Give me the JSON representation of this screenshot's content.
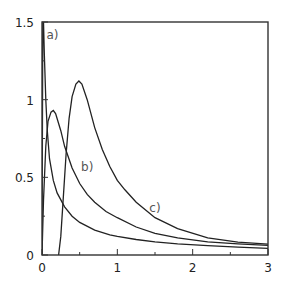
{
  "chart_data": {
    "type": "line",
    "title": "",
    "xlabel": "",
    "ylabel": "",
    "xlim": [
      0,
      3
    ],
    "ylim": [
      0,
      1.5
    ],
    "grid": false,
    "legend": "none (inline curve labels)",
    "x_ticks": [
      {
        "value": 0,
        "label": "0"
      },
      {
        "value": 1,
        "label": "1"
      },
      {
        "value": 2,
        "label": "2"
      },
      {
        "value": 3,
        "label": "3"
      }
    ],
    "x_minor_ticks": [
      0.5,
      1.5,
      2.5
    ],
    "y_ticks": [
      {
        "value": 0,
        "label": "0"
      },
      {
        "value": 0.5,
        "label": "0.5"
      },
      {
        "value": 1,
        "label": "1"
      },
      {
        "value": 1.5,
        "label": "1.5"
      }
    ],
    "y_minor_ticks": [
      0.25,
      0.75,
      1.25
    ],
    "series": [
      {
        "name": "a)",
        "label_pos": {
          "x": 0.14,
          "y": 1.39
        },
        "points": [
          [
            0.0,
            0.0
          ],
          [
            0.01,
            1.5
          ],
          [
            0.02,
            1.5
          ],
          [
            0.03,
            1.3
          ],
          [
            0.05,
            1.0
          ],
          [
            0.07,
            0.8
          ],
          [
            0.1,
            0.62
          ],
          [
            0.15,
            0.48
          ],
          [
            0.2,
            0.4
          ],
          [
            0.3,
            0.31
          ],
          [
            0.4,
            0.25
          ],
          [
            0.5,
            0.21
          ],
          [
            0.7,
            0.16
          ],
          [
            0.9,
            0.13
          ],
          [
            1.0,
            0.12
          ],
          [
            1.25,
            0.1
          ],
          [
            1.5,
            0.085
          ],
          [
            1.8,
            0.072
          ],
          [
            2.2,
            0.06
          ],
          [
            2.6,
            0.05
          ],
          [
            3.0,
            0.043
          ]
        ]
      },
      {
        "name": "b)",
        "label_pos": {
          "x": 0.6,
          "y": 0.54
        },
        "points": [
          [
            0.0,
            0.0
          ],
          [
            0.02,
            0.35
          ],
          [
            0.05,
            0.7
          ],
          [
            0.08,
            0.86
          ],
          [
            0.12,
            0.92
          ],
          [
            0.15,
            0.93
          ],
          [
            0.18,
            0.91
          ],
          [
            0.25,
            0.8
          ],
          [
            0.3,
            0.7
          ],
          [
            0.4,
            0.56
          ],
          [
            0.5,
            0.46
          ],
          [
            0.6,
            0.39
          ],
          [
            0.7,
            0.34
          ],
          [
            0.85,
            0.28
          ],
          [
            1.0,
            0.24
          ],
          [
            1.25,
            0.18
          ],
          [
            1.5,
            0.14
          ],
          [
            1.8,
            0.11
          ],
          [
            2.2,
            0.085
          ],
          [
            2.6,
            0.072
          ],
          [
            3.0,
            0.062
          ]
        ]
      },
      {
        "name": "c)",
        "label_pos": {
          "x": 1.5,
          "y": 0.28
        },
        "points": [
          [
            0.22,
            0.0
          ],
          [
            0.25,
            0.12
          ],
          [
            0.28,
            0.35
          ],
          [
            0.32,
            0.65
          ],
          [
            0.36,
            0.88
          ],
          [
            0.4,
            1.02
          ],
          [
            0.45,
            1.1
          ],
          [
            0.49,
            1.12
          ],
          [
            0.53,
            1.1
          ],
          [
            0.6,
            1.0
          ],
          [
            0.7,
            0.82
          ],
          [
            0.8,
            0.68
          ],
          [
            0.9,
            0.57
          ],
          [
            1.0,
            0.48
          ],
          [
            1.1,
            0.42
          ],
          [
            1.25,
            0.34
          ],
          [
            1.5,
            0.24
          ],
          [
            1.8,
            0.17
          ],
          [
            2.2,
            0.11
          ],
          [
            2.6,
            0.083
          ],
          [
            3.0,
            0.07
          ]
        ]
      }
    ]
  },
  "layout": {
    "plot_px": {
      "left": 42,
      "right": 268,
      "top": 22,
      "bottom": 255
    }
  }
}
